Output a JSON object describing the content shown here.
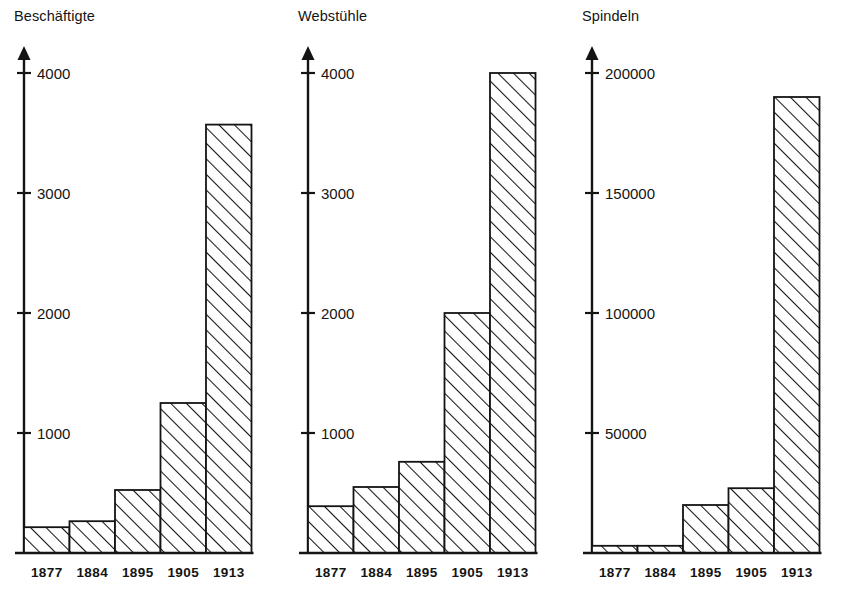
{
  "figure": {
    "background": "#ffffff",
    "ink": "#141414",
    "bar_fill": "hatch-diagonal",
    "panel_count": 3
  },
  "chart_data": [
    {
      "type": "bar",
      "title": "Beschäftigte",
      "xlabel": "",
      "ylabel": "Beschäftigte",
      "categories": [
        "1877",
        "1884",
        "1895",
        "1905",
        "1913"
      ],
      "values": [
        215,
        265,
        525,
        1250,
        3570
      ],
      "ylim": [
        0,
        4300
      ],
      "yticks": [
        1000,
        2000,
        3000,
        4000
      ],
      "ytick_labels": [
        "1000",
        "2000",
        "3000",
        "4000"
      ],
      "grid": false,
      "legend": "none",
      "axis_arrow": true
    },
    {
      "type": "bar",
      "title": "Webstühle",
      "xlabel": "",
      "ylabel": "Webstühle",
      "categories": [
        "1877",
        "1884",
        "1895",
        "1905",
        "1913"
      ],
      "values": [
        390,
        550,
        760,
        2000,
        4000
      ],
      "ylim": [
        0,
        4300
      ],
      "yticks": [
        1000,
        2000,
        3000,
        4000
      ],
      "ytick_labels": [
        "1000",
        "2000",
        "3000",
        "4000"
      ],
      "grid": false,
      "legend": "none",
      "axis_arrow": true
    },
    {
      "type": "bar",
      "title": "Spindeln",
      "xlabel": "",
      "ylabel": "Spindeln",
      "categories": [
        "1877",
        "1884",
        "1895",
        "1905",
        "1913"
      ],
      "values": [
        3000,
        3000,
        20000,
        27000,
        190000
      ],
      "ylim": [
        0,
        215000
      ],
      "yticks": [
        50000,
        100000,
        150000,
        200000
      ],
      "ytick_labels": [
        "50000",
        "100000",
        "150000",
        "200000"
      ],
      "grid": false,
      "legend": "none",
      "axis_arrow": true
    }
  ]
}
